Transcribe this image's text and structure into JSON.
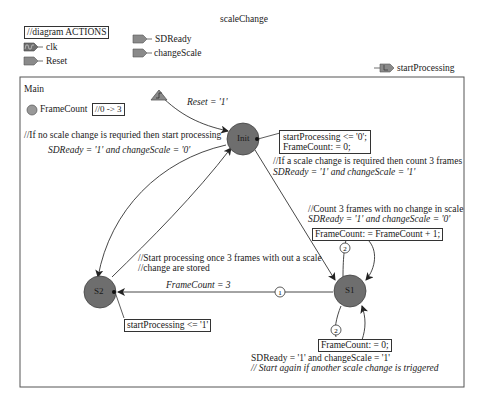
{
  "diagram": {
    "title": "scaleChange",
    "actions_label": "//diagram ACTIONS",
    "inputs": [
      {
        "name": "clk",
        "icon": "clock-port-icon"
      },
      {
        "name": "Reset",
        "icon": "input-port-icon"
      },
      {
        "name": "SDReady",
        "icon": "input-port-icon"
      },
      {
        "name": "changeScale",
        "icon": "input-port-icon"
      }
    ],
    "outputs": [
      {
        "name": "startProcessing",
        "icon": "output-port-icon"
      }
    ]
  },
  "main": {
    "label": "Main",
    "variable": {
      "name": "FrameCount",
      "range": "//0 -> 3"
    },
    "states": [
      {
        "id": "Init",
        "label": "Init",
        "actions": [
          "startProcessing <= '0';",
          "FrameCount: = 0;"
        ]
      },
      {
        "id": "S1",
        "label": "S1"
      },
      {
        "id": "S2",
        "label": "S2",
        "actions": [
          "startProcessing <= '1'"
        ]
      }
    ],
    "reset": {
      "condition": "Reset = '1'"
    },
    "transitions": {
      "init_to_s2": {
        "comment": "//If no scale change is requried then start processing",
        "condition": "SDReady = '1' and changeScale = '0'"
      },
      "init_to_s1": {
        "comment": "//If a scale change is required then count 3 frames",
        "condition": "SDReady = '1' and changeScale = '1'"
      },
      "s1_self_count": {
        "comment": "//Count 3 frames with no change in scale",
        "condition": "SDReady = '1' and changeScale = '0'",
        "action": "FrameCount: = FrameCount + 1;",
        "priority": "2"
      },
      "s1_to_s2": {
        "comment1": "//Start processing once 3 frames with out a scale",
        "comment2": "//change are stored",
        "condition": "FrameCount = 3",
        "priority": "1"
      },
      "s1_self_reset": {
        "action": "FrameCount: = 0;",
        "condition": "SDReady = '1'  and changeScale = '1'",
        "comment": "// Start again if another scale change is triggered",
        "priority": "2"
      }
    }
  },
  "colors": {
    "state_fill": "#6e6e6e",
    "port_fill": "#8a8a8a",
    "line": "#333333"
  }
}
